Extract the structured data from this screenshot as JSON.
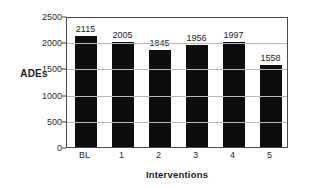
{
  "chart_data": {
    "type": "bar",
    "title": "",
    "categories": [
      "BL",
      "1",
      "2",
      "3",
      "4",
      "5"
    ],
    "values": [
      2115,
      2005,
      1845,
      1956,
      1997,
      1558
    ],
    "data_labels": [
      "2115",
      "2005",
      "1845",
      "1956",
      "1997",
      "1558"
    ],
    "xlabel": "Interventions",
    "ylabel": "ADEs",
    "ylim": [
      0,
      2500
    ],
    "yticks": [
      0,
      500,
      1000,
      1500,
      2000,
      2500
    ],
    "ytick_labels": [
      "0",
      "500",
      "1000",
      "1500",
      "2000",
      "2500"
    ],
    "grid": "horizontal",
    "legend": "none",
    "bar_color": "#0d0d0d",
    "grid_color": "#b8b8b8",
    "frame_color": "#4a4a4a",
    "background_color": "#ffffff"
  }
}
